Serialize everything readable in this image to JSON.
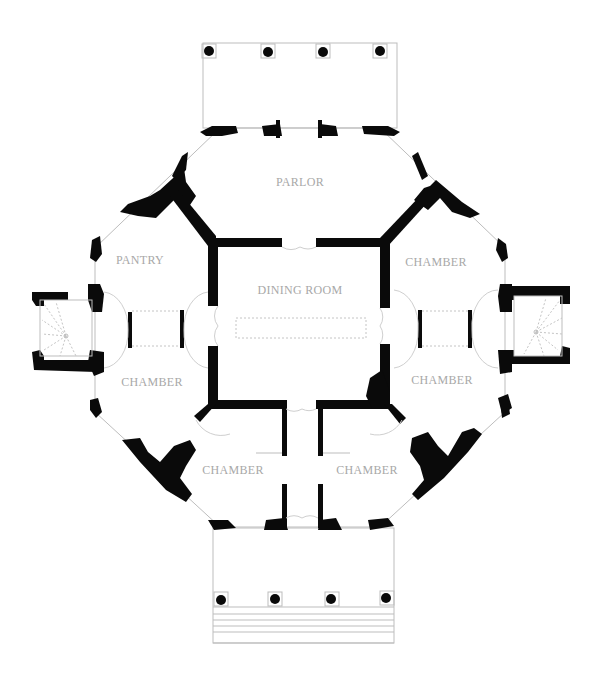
{
  "plan": {
    "type": "octagonal house floor plan",
    "colors": {
      "wall": "#0a0a0a",
      "label": "#a8a8a8",
      "line": "#bdbdbd",
      "background": "#ffffff"
    },
    "rooms": [
      {
        "id": "parlor",
        "label": "PARLOR",
        "x": 300,
        "y": 186
      },
      {
        "id": "pantry",
        "label": "PANTRY",
        "x": 140,
        "y": 264
      },
      {
        "id": "dining-room",
        "label": "DINING ROOM",
        "x": 300,
        "y": 294
      },
      {
        "id": "chamber-ne",
        "label": "CHAMBER",
        "x": 436,
        "y": 266
      },
      {
        "id": "chamber-w",
        "label": "CHAMBER",
        "x": 152,
        "y": 386
      },
      {
        "id": "chamber-e",
        "label": "CHAMBER",
        "x": 442,
        "y": 384
      },
      {
        "id": "chamber-sw",
        "label": "CHAMBER",
        "x": 233,
        "y": 474
      },
      {
        "id": "chamber-se",
        "label": "CHAMBER",
        "x": 367,
        "y": 474
      }
    ],
    "porticos": {
      "north": {
        "columns": 4
      },
      "south": {
        "columns": 4,
        "steps": 5
      }
    },
    "stair_towers": [
      "west",
      "east"
    ]
  }
}
